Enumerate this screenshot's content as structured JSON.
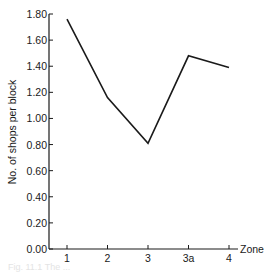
{
  "chart_data": {
    "type": "line",
    "title": "",
    "xlabel": "Zone",
    "ylabel": "No. of shops per block",
    "categories": [
      "1",
      "2",
      "3",
      "3a",
      "4"
    ],
    "values": [
      1.76,
      1.16,
      0.81,
      1.48,
      1.39
    ],
    "series": [
      {
        "name": "Shops per block",
        "values": [
          1.76,
          1.16,
          0.81,
          1.48,
          1.39
        ]
      }
    ],
    "ylim": [
      0.0,
      1.8
    ],
    "yticks": [
      "0.00",
      "0.20",
      "0.40",
      "0.60",
      "0.80",
      "1.00",
      "1.20",
      "1.40",
      "1.60",
      "1.80"
    ],
    "grid": false,
    "legend": "none",
    "line_color": "#1a1a1a"
  },
  "caption": "Fig. 11.1 The ..."
}
